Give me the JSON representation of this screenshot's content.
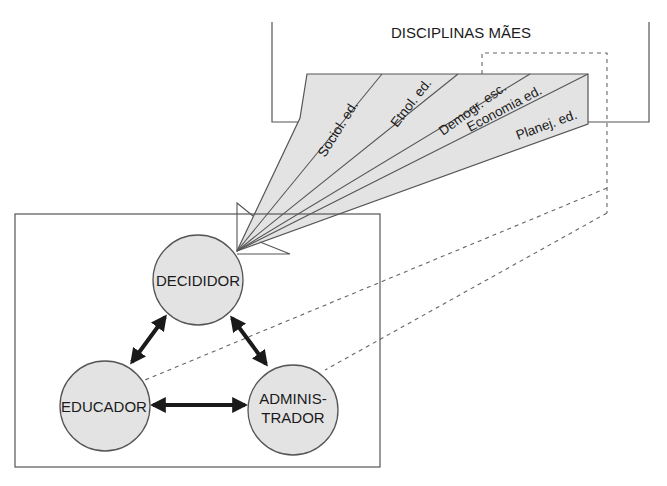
{
  "title": "DISCIPLINAS MÃES",
  "disciplines": [
    {
      "label": "Sociol. ed."
    },
    {
      "label": "Etnol. ed."
    },
    {
      "label": "Demogr. esc."
    },
    {
      "label": "Economia ed."
    },
    {
      "label": "Planej. ed."
    }
  ],
  "nodes": {
    "decididor": {
      "label": "DECIDIDOR"
    },
    "educador": {
      "label": "EDUCADOR"
    },
    "administrador": {
      "line1": "ADMINIS-",
      "line2": "TRADOR"
    }
  },
  "colors": {
    "fill": "#e3e3e3",
    "stroke": "#555555",
    "arrow": "#1a1a1a"
  }
}
